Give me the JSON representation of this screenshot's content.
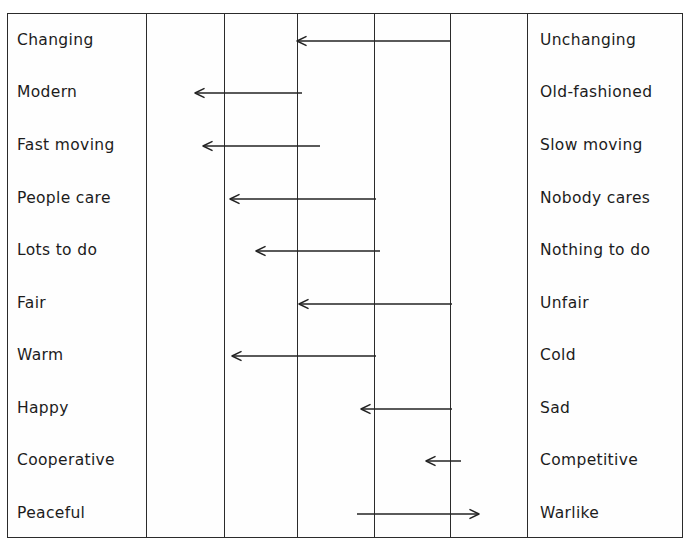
{
  "figure": {
    "type": "semantic-differential-scale",
    "frame": {
      "left": 7,
      "top": 13,
      "width": 676,
      "height": 525
    },
    "column_lines_x": [
      146,
      224,
      297,
      374,
      450,
      527
    ],
    "scale_points": 7,
    "row_height": 52.2,
    "first_row_center_y": 41,
    "colors": {
      "ink": "#2b2b2b",
      "text": "#1c1c1c",
      "arrow": "#232323",
      "paper": "#fefefe"
    },
    "rows": [
      {
        "left_label": "Changing",
        "right_label": "Unchanging",
        "center_y": 41,
        "arrow": {
          "from_x": 450,
          "to_x": 297,
          "direction": "left"
        }
      },
      {
        "left_label": "Modern",
        "right_label": "Old-fashioned",
        "center_y": 93,
        "arrow": {
          "from_x": 302,
          "to_x": 195,
          "direction": "left"
        }
      },
      {
        "left_label": "Fast moving",
        "right_label": "Slow moving",
        "center_y": 146,
        "arrow": {
          "from_x": 320,
          "to_x": 203,
          "direction": "left"
        }
      },
      {
        "left_label": "People care",
        "right_label": "Nobody cares",
        "center_y": 199,
        "arrow": {
          "from_x": 376,
          "to_x": 230,
          "direction": "left"
        }
      },
      {
        "left_label": "Lots to do",
        "right_label": "Nothing to do",
        "center_y": 251,
        "arrow": {
          "from_x": 380,
          "to_x": 256,
          "direction": "left"
        }
      },
      {
        "left_label": "Fair",
        "right_label": "Unfair",
        "center_y": 304,
        "arrow": {
          "from_x": 452,
          "to_x": 299,
          "direction": "left"
        }
      },
      {
        "left_label": "Warm",
        "right_label": "Cold",
        "center_y": 356,
        "arrow": {
          "from_x": 376,
          "to_x": 232,
          "direction": "left"
        }
      },
      {
        "left_label": "Happy",
        "right_label": "Sad",
        "center_y": 409,
        "arrow": {
          "from_x": 452,
          "to_x": 361,
          "direction": "left"
        }
      },
      {
        "left_label": "Cooperative",
        "right_label": "Competitive",
        "center_y": 461,
        "arrow": {
          "from_x": 461,
          "to_x": 426,
          "direction": "left"
        }
      },
      {
        "left_label": "Peaceful",
        "right_label": "Warlike",
        "center_y": 514,
        "arrow": {
          "from_x": 357,
          "to_x": 479,
          "direction": "right"
        }
      }
    ]
  }
}
